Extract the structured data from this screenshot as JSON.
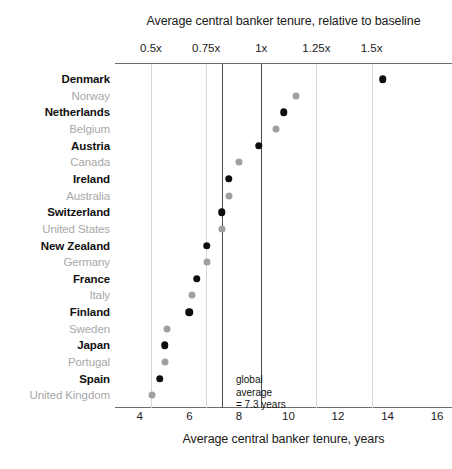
{
  "chart_data": {
    "type": "scatter",
    "title": "Average central banker tenure, relative to baseline",
    "xlabel_bottom": "Average central banker tenure, years",
    "xlabel_top": "Average central banker tenure, relative to baseline",
    "ylabel": "",
    "grid": true,
    "legend_position": "none",
    "x_axis_top": {
      "label": "Average central banker tenure, relative to baseline",
      "ticks": [
        "0.5x",
        "0.75x",
        "1x",
        "1.25x",
        "1.5x"
      ],
      "tick_values": [
        0.5,
        0.75,
        1.0,
        1.25,
        1.5
      ]
    },
    "x_axis_bottom": {
      "label": "Average central banker tenure, years",
      "ticks": [
        "4",
        "6",
        "8",
        "10",
        "12",
        "14",
        "16"
      ],
      "tick_values": [
        4,
        6,
        8,
        10,
        12,
        14,
        16
      ],
      "xlim": [
        3.0,
        16.6
      ]
    },
    "annotation": {
      "text": "global\naverage\n= 7.3 years",
      "line_value": 7.3,
      "line_label": "global average = 7.3 years"
    },
    "categories": [
      "Denmark",
      "Norway",
      "Netherlands",
      "Belgium",
      "Austria",
      "Canada",
      "Ireland",
      "Australia",
      "Switzerland",
      "United States",
      "New Zealand",
      "Germany",
      "France",
      "Italy",
      "Finland",
      "Sweden",
      "Japan",
      "Portugal",
      "Spain",
      "United Kingdom"
    ],
    "points": [
      {
        "label": "Denmark",
        "years": 13.8,
        "relative": 1.55,
        "highlighted": true
      },
      {
        "label": "Norway",
        "years": 10.3,
        "relative": 1.16,
        "highlighted": false
      },
      {
        "label": "Netherlands",
        "years": 9.8,
        "relative": 1.1,
        "highlighted": true
      },
      {
        "label": "Belgium",
        "years": 9.5,
        "relative": 1.07,
        "highlighted": false
      },
      {
        "label": "Austria",
        "years": 8.8,
        "relative": 0.99,
        "highlighted": true
      },
      {
        "label": "Canada",
        "years": 8.0,
        "relative": 0.9,
        "highlighted": false
      },
      {
        "label": "Ireland",
        "years": 7.6,
        "relative": 0.86,
        "highlighted": true
      },
      {
        "label": "Australia",
        "years": 7.6,
        "relative": 0.85,
        "highlighted": false
      },
      {
        "label": "Switzerland",
        "years": 7.3,
        "relative": 0.82,
        "highlighted": true
      },
      {
        "label": "United States",
        "years": 7.3,
        "relative": 0.82,
        "highlighted": false
      },
      {
        "label": "New Zealand",
        "years": 6.7,
        "relative": 0.76,
        "highlighted": true
      },
      {
        "label": "Germany",
        "years": 6.7,
        "relative": 0.76,
        "highlighted": false
      },
      {
        "label": "France",
        "years": 6.3,
        "relative": 0.71,
        "highlighted": true
      },
      {
        "label": "Italy",
        "years": 6.1,
        "relative": 0.69,
        "highlighted": false
      },
      {
        "label": "Finland",
        "years": 6.0,
        "relative": 0.67,
        "highlighted": true
      },
      {
        "label": "Sweden",
        "years": 5.1,
        "relative": 0.58,
        "highlighted": false
      },
      {
        "label": "Japan",
        "years": 5.0,
        "relative": 0.57,
        "highlighted": true
      },
      {
        "label": "Portugal",
        "years": 5.0,
        "relative": 0.56,
        "highlighted": false
      },
      {
        "label": "Spain",
        "years": 4.8,
        "relative": 0.54,
        "highlighted": true
      },
      {
        "label": "United Kingdom",
        "years": 4.5,
        "relative": 0.5,
        "highlighted": false
      }
    ],
    "colors": {
      "highlighted_dot": "#0d0d0d",
      "other_dot": "#a0a0a0",
      "highlighted_label": "#111111",
      "other_label": "#a8a8a8",
      "gridline": "#d8d8d8",
      "baseline": "#4a4a4a",
      "axis": "#6e6e6e",
      "background": "#ffffff"
    }
  }
}
